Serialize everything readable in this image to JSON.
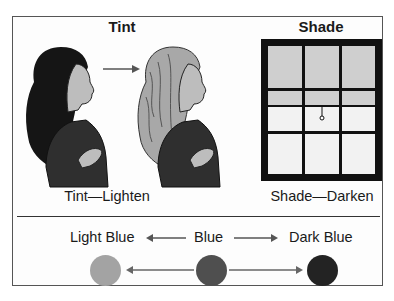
{
  "tint": {
    "title": "Tint",
    "caption": "Tint—Lighten",
    "illustration_before": "woman-dark-hair",
    "illustration_after": "woman-light-hair"
  },
  "shade": {
    "title": "Shade",
    "caption": "Shade—Darken",
    "illustration": "window-with-pulled-shade"
  },
  "scale": {
    "labels": [
      "Light Blue",
      "Blue",
      "Dark Blue"
    ],
    "colors": {
      "light_blue": "#a3a3a3",
      "blue": "#4f4f4f",
      "dark_blue": "#232323"
    }
  }
}
